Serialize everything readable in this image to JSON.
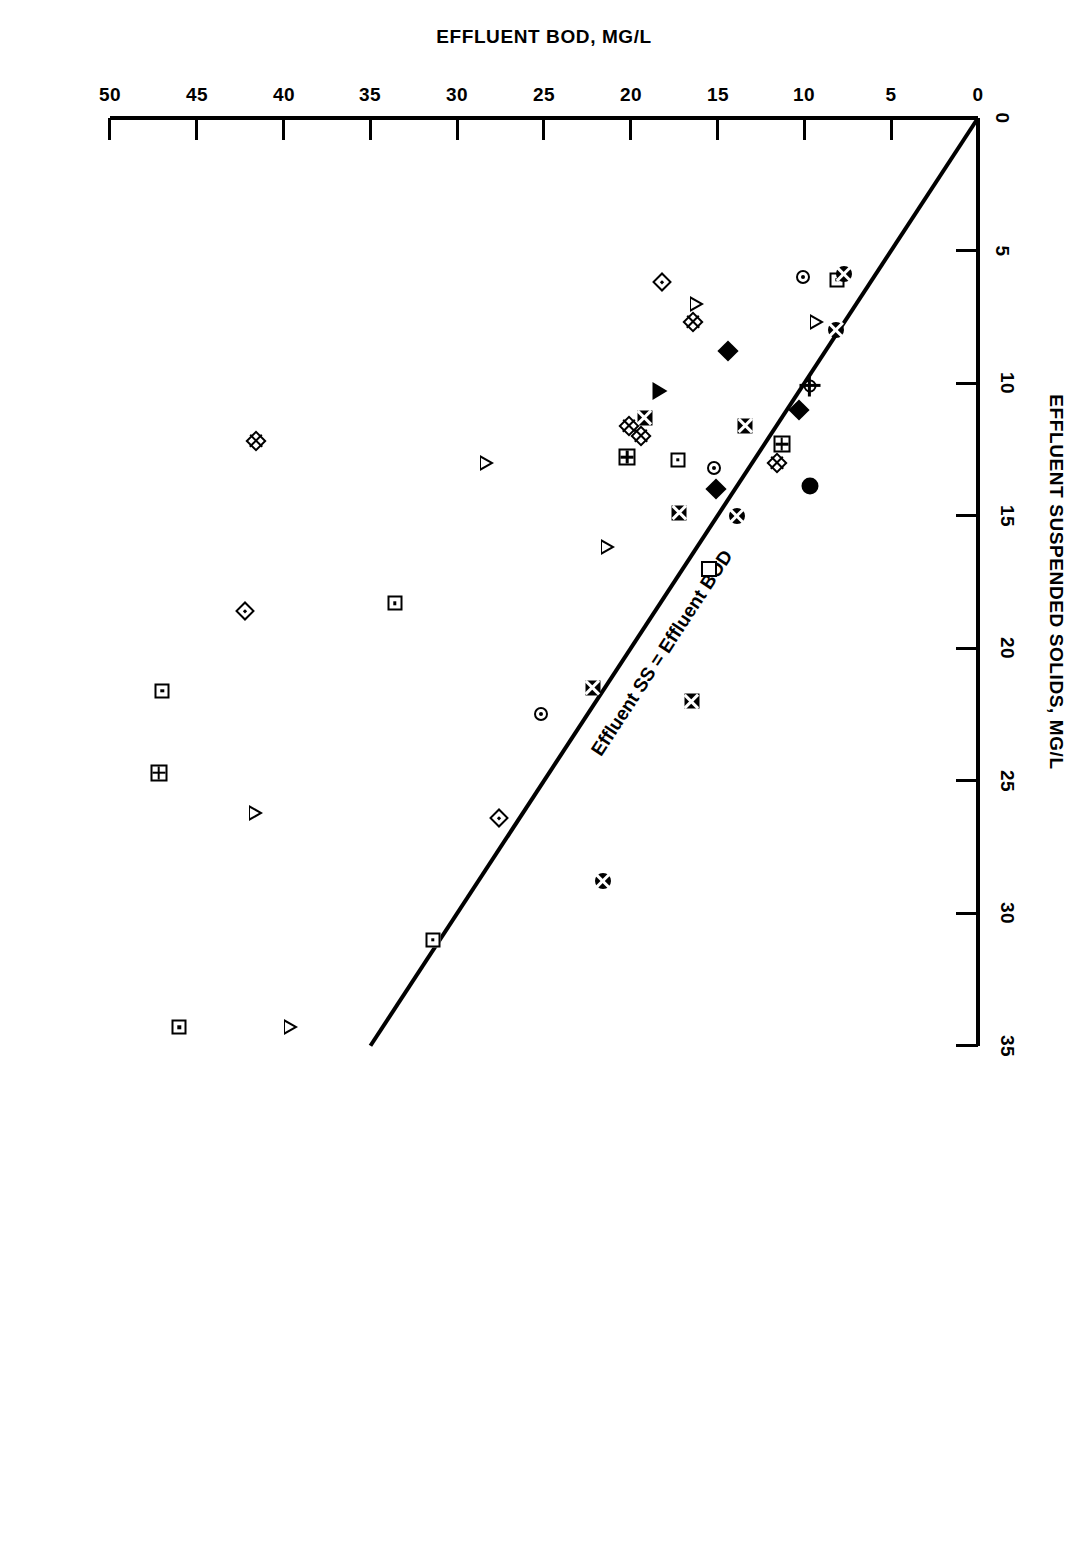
{
  "figure": {
    "background": "#ffffff",
    "ink": "#000000",
    "orientation_note": "page printed rotated 180 degrees"
  },
  "axes": {
    "x": {
      "title": "EFFLUENT BOD, MG/L",
      "ticks": [
        "0",
        "5",
        "10",
        "15",
        "20",
        "25",
        "30",
        "35",
        "40",
        "45",
        "50"
      ],
      "min": 0,
      "max": 50
    },
    "y": {
      "title": "EFFLUENT SUSPENDED SOLIDS, MG/L",
      "ticks": [
        "0",
        "5",
        "10",
        "15",
        "20",
        "25",
        "30",
        "35"
      ],
      "min": 0,
      "max": 35
    }
  },
  "annotations": {
    "equality_line_label": "Effluent SS = Effluent BOD"
  },
  "chart_data": {
    "type": "scatter",
    "title": "",
    "xlabel": "EFFLUENT BOD, MG/L",
    "ylabel": "EFFLUENT SUSPENDED SOLIDS, MG/L",
    "xlim": [
      0,
      50
    ],
    "ylim": [
      0,
      35
    ],
    "grid": false,
    "legend": "none",
    "reference_line": {
      "label": "Effluent SS = Effluent BOD",
      "equation": "y = x",
      "from": [
        0,
        0
      ],
      "to": [
        35,
        35
      ]
    },
    "points": [
      {
        "x": 46.0,
        "y": 34.3,
        "marker": "square-dot"
      },
      {
        "x": 47.2,
        "y": 24.7,
        "marker": "square-pane"
      },
      {
        "x": 47.0,
        "y": 21.6,
        "marker": "square-dot"
      },
      {
        "x": 42.2,
        "y": 18.6,
        "marker": "diamond-dot"
      },
      {
        "x": 41.6,
        "y": 26.2,
        "marker": "triangle-open"
      },
      {
        "x": 41.6,
        "y": 12.2,
        "marker": "diamond-cross"
      },
      {
        "x": 39.6,
        "y": 34.3,
        "marker": "triangle-open"
      },
      {
        "x": 33.6,
        "y": 18.3,
        "marker": "square-dot"
      },
      {
        "x": 31.4,
        "y": 31.0,
        "marker": "square-dot"
      },
      {
        "x": 28.3,
        "y": 13.0,
        "marker": "triangle-open"
      },
      {
        "x": 27.6,
        "y": 26.4,
        "marker": "diamond-dot"
      },
      {
        "x": 25.2,
        "y": 22.5,
        "marker": "circle-dot"
      },
      {
        "x": 22.2,
        "y": 21.5,
        "marker": "square-x"
      },
      {
        "x": 21.6,
        "y": 28.8,
        "marker": "circle-x"
      },
      {
        "x": 21.3,
        "y": 16.2,
        "marker": "triangle-open"
      },
      {
        "x": 20.2,
        "y": 12.8,
        "marker": "square-pane"
      },
      {
        "x": 20.1,
        "y": 11.6,
        "marker": "diamond-cross"
      },
      {
        "x": 19.4,
        "y": 12.0,
        "marker": "diamond-cross"
      },
      {
        "x": 19.2,
        "y": 11.3,
        "marker": "square-x"
      },
      {
        "x": 18.3,
        "y": 10.3,
        "marker": "triangle-filled"
      },
      {
        "x": 18.2,
        "y": 6.2,
        "marker": "diamond-dot"
      },
      {
        "x": 17.2,
        "y": 14.9,
        "marker": "square-x"
      },
      {
        "x": 17.3,
        "y": 12.9,
        "marker": "square-dot"
      },
      {
        "x": 16.5,
        "y": 22.0,
        "marker": "square-x"
      },
      {
        "x": 16.4,
        "y": 7.7,
        "marker": "diamond-cross"
      },
      {
        "x": 16.2,
        "y": 7.0,
        "marker": "triangle-open"
      },
      {
        "x": 15.5,
        "y": 17.0,
        "marker": "square-open"
      },
      {
        "x": 15.2,
        "y": 13.2,
        "marker": "circle-dot"
      },
      {
        "x": 15.1,
        "y": 14.0,
        "marker": "diamond-filled"
      },
      {
        "x": 14.4,
        "y": 8.8,
        "marker": "diamond-filled"
      },
      {
        "x": 13.9,
        "y": 15.0,
        "marker": "circle-x"
      },
      {
        "x": 13.4,
        "y": 11.6,
        "marker": "square-x"
      },
      {
        "x": 11.6,
        "y": 13.0,
        "marker": "diamond-cross"
      },
      {
        "x": 11.3,
        "y": 12.3,
        "marker": "square-pane"
      },
      {
        "x": 10.3,
        "y": 11.0,
        "marker": "diamond-filled"
      },
      {
        "x": 10.1,
        "y": 6.0,
        "marker": "circle-dot"
      },
      {
        "x": 9.7,
        "y": 13.9,
        "marker": "circle-filled"
      },
      {
        "x": 9.7,
        "y": 10.1,
        "marker": "circle-tick"
      },
      {
        "x": 9.3,
        "y": 7.7,
        "marker": "triangle-open"
      },
      {
        "x": 8.2,
        "y": 8.0,
        "marker": "circle-x"
      },
      {
        "x": 8.1,
        "y": 6.1,
        "marker": "square-dot"
      },
      {
        "x": 7.7,
        "y": 5.9,
        "marker": "circle-x"
      }
    ]
  }
}
